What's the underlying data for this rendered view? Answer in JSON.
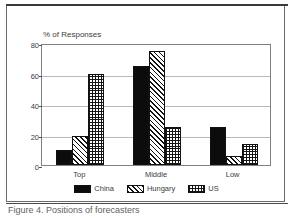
{
  "figure": {
    "caption": "Figure 4.  Positions of forecasters"
  },
  "chart_data": {
    "type": "bar",
    "title": "",
    "axis_title": "% of Responses",
    "xlabel": "",
    "ylabel": "% of Responses",
    "categories": [
      "Top",
      "Middle",
      "Low"
    ],
    "series": [
      {
        "name": "China",
        "values": [
          10,
          65,
          25
        ],
        "fill": "solid"
      },
      {
        "name": "Hungary",
        "values": [
          19,
          75,
          6
        ],
        "fill": "diagonal-hatch"
      },
      {
        "name": "US",
        "values": [
          60,
          25,
          14
        ],
        "fill": "crosshatch-grid"
      }
    ],
    "ylim": [
      0,
      80
    ],
    "yticks": [
      0,
      20,
      40,
      60,
      80
    ],
    "ytick_labels": [
      "0",
      "20",
      "40",
      "60",
      "80"
    ],
    "grid": true,
    "grid_axis": "y",
    "legend_position": "bottom-center",
    "colors": {
      "ink": "#0c0c0c",
      "frame": "#808080",
      "grid": "#b9b9b9",
      "background": "#ffffff"
    }
  }
}
